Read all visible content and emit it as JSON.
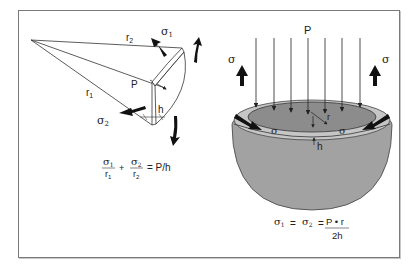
{
  "left_panel": {
    "labels": {
      "r1": "r",
      "r1_sub": "1",
      "r2": "r",
      "r2_sub": "2",
      "sigma1": "σ",
      "sigma1_sub": "1",
      "sigma2": "σ",
      "sigma2_sub": "2",
      "P": "P",
      "h": "h"
    },
    "equation": {
      "term1_num": "σ",
      "term1_num_sub": "1",
      "term1_den": "r",
      "term1_den_sub": "1",
      "plus": "+",
      "term2_num": "σ",
      "term2_num_sub": "2",
      "term2_den": "r",
      "term2_den_sub": "2",
      "rhs": "= P/h"
    }
  },
  "right_panel": {
    "labels": {
      "P": "P",
      "sigma_left": "σ",
      "sigma_right": "σ",
      "sigma_rim_left": "σ",
      "sigma_rim_right": "σ",
      "r": "r",
      "h": "h"
    },
    "equation": {
      "lhs1": "σ",
      "lhs1_sub": "1",
      "eq1": "=",
      "lhs2": "σ",
      "lhs2_sub": "2",
      "eq2": "=",
      "num": "P • r",
      "den": "2h"
    }
  },
  "colors": {
    "frame": "#7a7a7a",
    "bowl_outer": "#a0a0a0",
    "bowl_rim": "#c4c4c4",
    "bowl_inner": "#8a8a8a",
    "arrow": "#111111",
    "line": "#333333"
  }
}
